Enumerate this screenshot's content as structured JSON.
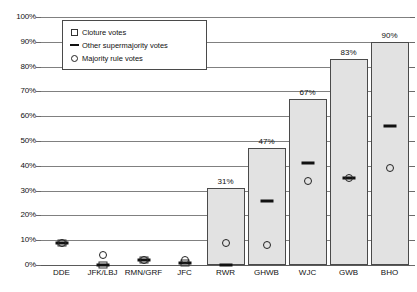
{
  "chart_data": {
    "type": "bar",
    "title": "",
    "subtitle": "",
    "xlabel": "",
    "ylabel": "",
    "ylim": [
      0,
      100
    ],
    "grid": true,
    "legend_position": "top-left",
    "categories": [
      "DDE",
      "JFK/LBJ",
      "RMN/GRF",
      "JFC",
      "RWR",
      "GHWB",
      "WJC",
      "GWB",
      "BHO"
    ],
    "y_ticks": [
      "0%",
      "10%",
      "20%",
      "30%",
      "40%",
      "50%",
      "60%",
      "70%",
      "80%",
      "90%",
      "100%"
    ],
    "y_tick_values": [
      0,
      10,
      20,
      30,
      40,
      50,
      60,
      70,
      80,
      90,
      100
    ],
    "series": [
      {
        "name": "Cloture votes",
        "marker": "square-bar",
        "values": [
          9,
          0,
          2,
          1,
          31,
          47,
          67,
          83,
          90
        ],
        "data_labels": [
          "",
          "",
          "",
          "",
          "31%",
          "47%",
          "67%",
          "83%",
          "90%"
        ]
      },
      {
        "name": "Other supermajority votes",
        "marker": "dash",
        "values": [
          9,
          0,
          2,
          1,
          0,
          26,
          41,
          35,
          56
        ],
        "data_labels": [
          "",
          "",
          "",
          "",
          "",
          "",
          "",
          "",
          ""
        ]
      },
      {
        "name": "Majority rule votes",
        "marker": "circle",
        "values": [
          9,
          4,
          2,
          2,
          9,
          8,
          34,
          35,
          39
        ],
        "data_labels": [
          "",
          "",
          "",
          "",
          "",
          "",
          "",
          "",
          ""
        ]
      }
    ]
  },
  "legend": {
    "items": [
      {
        "label": "Cloture votes",
        "glyph": "square-marker-icon"
      },
      {
        "label": "Other supermajority votes",
        "glyph": "dash-marker-icon"
      },
      {
        "label": "Majority rule votes",
        "glyph": "circle-marker-icon"
      }
    ]
  },
  "colors": {
    "bar_fill": "#e2e2e2",
    "bar_stroke": "#4a4a4a",
    "gridline": "#808080",
    "text": "#111111",
    "background": "#ffffff"
  }
}
